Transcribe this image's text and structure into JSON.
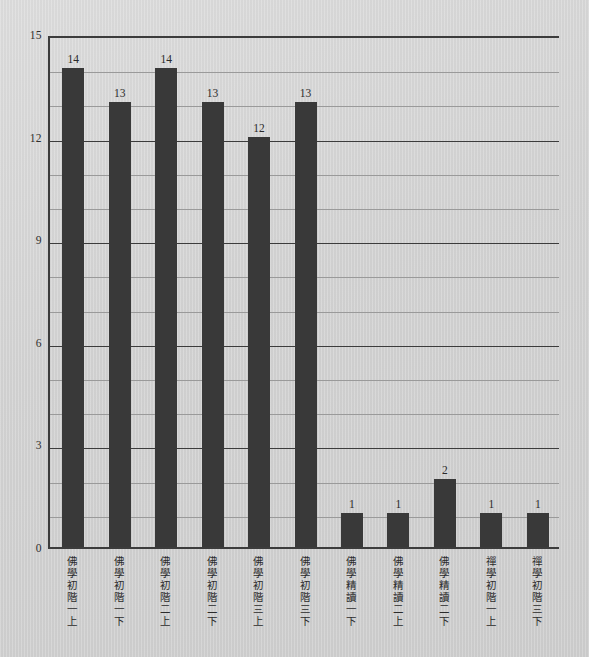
{
  "chart_data": {
    "type": "bar",
    "title": "",
    "subtitle": "",
    "xlabel": "",
    "ylabel": "",
    "ylim": [
      0,
      15
    ],
    "yticks": [
      0,
      3,
      6,
      9,
      12,
      15
    ],
    "ytick_labels": [
      "0",
      "3",
      "6",
      "9",
      "12",
      "15"
    ],
    "grid": true,
    "grid_minor_step": 1,
    "grid_major_step": 3,
    "legend": "none",
    "bar_color": "#393939",
    "plot_background": "#d5d5d5",
    "axis_color": "#3c3c3c",
    "categories": [
      "佛學初階一上",
      "佛學初階一下",
      "佛學初階二上",
      "佛學初階二下",
      "佛學初階三上",
      "佛學初階三下",
      "佛學精讀一下",
      "佛學精讀二上",
      "佛學精讀二下",
      "禪學初階一上",
      "禪學初階三下"
    ],
    "values": [
      14,
      13,
      14,
      13,
      12,
      13,
      1,
      1,
      2,
      1,
      1
    ],
    "value_labels": [
      "14",
      "13",
      "14",
      "13",
      "12",
      "13",
      "1",
      "1",
      "2",
      "1",
      "1"
    ]
  }
}
